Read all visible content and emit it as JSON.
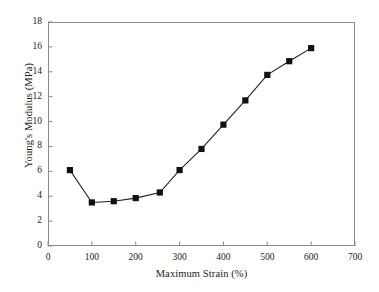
{
  "chart_data": {
    "type": "line",
    "title": "",
    "subtitle": "",
    "xlabel": "Maximum Strain (%)",
    "ylabel": "Young's Modulus (MPa)",
    "xlim": [
      0,
      700
    ],
    "ylim": [
      0,
      18
    ],
    "xticks": [
      0,
      100,
      200,
      300,
      400,
      500,
      600,
      700
    ],
    "xtick_labels": [
      "0",
      "100",
      "200",
      "300",
      "400",
      "500",
      "600",
      "700"
    ],
    "yticks": [
      0,
      2,
      4,
      6,
      8,
      10,
      12,
      14,
      16,
      18
    ],
    "ytick_labels": [
      "0",
      "2",
      "4",
      "6",
      "8",
      "10",
      "12",
      "14",
      "16",
      "18"
    ],
    "grid": false,
    "legend": null,
    "legend_position": "none",
    "marker": "square",
    "marker_color": "#111111",
    "line_color": "#222222",
    "axis_color": "#8a8a8a",
    "background": "#ffffff",
    "x": [
      50,
      100,
      150,
      200,
      255,
      300,
      350,
      400,
      450,
      500,
      550,
      600
    ],
    "y": [
      6.1,
      3.5,
      3.6,
      3.85,
      4.3,
      6.1,
      7.8,
      9.75,
      11.7,
      13.75,
      14.85,
      15.9
    ],
    "series": [
      {
        "name": "Young's Modulus",
        "points": [
          {
            "x": 50,
            "y": 6.1
          },
          {
            "x": 100,
            "y": 3.5
          },
          {
            "x": 150,
            "y": 3.6
          },
          {
            "x": 200,
            "y": 3.85
          },
          {
            "x": 255,
            "y": 4.3
          },
          {
            "x": 300,
            "y": 6.1
          },
          {
            "x": 350,
            "y": 7.8
          },
          {
            "x": 400,
            "y": 9.75
          },
          {
            "x": 450,
            "y": 11.7
          },
          {
            "x": 500,
            "y": 13.75
          },
          {
            "x": 550,
            "y": 14.85
          },
          {
            "x": 600,
            "y": 15.9
          }
        ]
      }
    ],
    "annotations": []
  }
}
